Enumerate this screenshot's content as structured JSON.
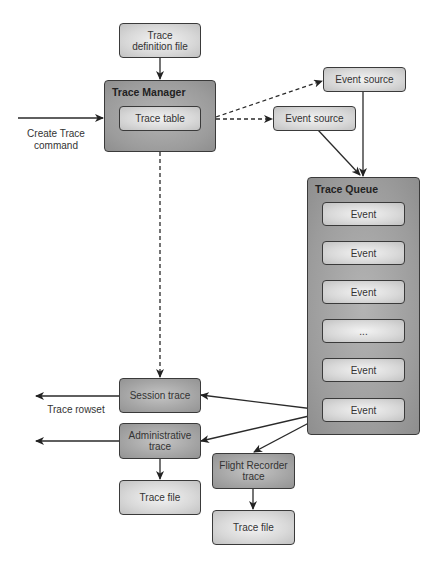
{
  "diagram": {
    "nodes": {
      "trace_definition_file": "Trace definition file",
      "trace_manager": {
        "title": "Trace Manager",
        "trace_table": "Trace table"
      },
      "event_source_1": "Event source",
      "event_source_2": "Event source",
      "trace_queue": {
        "title": "Trace Queue",
        "events": [
          "Event",
          "Event",
          "Event",
          "...",
          "Event",
          "Event"
        ]
      },
      "session_trace": "Session trace",
      "administrative_trace": "Administrative trace",
      "trace_file_admin": "Trace file",
      "flight_recorder_trace": "Flight Recorder trace",
      "trace_file_flight": "Trace file"
    },
    "labels": {
      "create_trace_command": "Create Trace command",
      "trace_rowset": "Trace rowset"
    },
    "edges": [
      {
        "from": "Trace definition file",
        "to": "Trace Manager",
        "style": "solid"
      },
      {
        "from": "Create Trace command",
        "to": "Trace Manager",
        "style": "solid"
      },
      {
        "from": "Trace Manager",
        "to": "Event source (top)",
        "style": "dashed"
      },
      {
        "from": "Trace Manager",
        "to": "Event source (lower)",
        "style": "dashed"
      },
      {
        "from": "Event source (top)",
        "to": "Trace Queue",
        "style": "solid"
      },
      {
        "from": "Event source (lower)",
        "to": "Trace Queue",
        "style": "solid"
      },
      {
        "from": "Trace Manager",
        "to": "Session trace",
        "style": "dashed"
      },
      {
        "from": "Event (last)",
        "to": "Session trace",
        "style": "solid"
      },
      {
        "from": "Event (last)",
        "to": "Administrative trace",
        "style": "solid"
      },
      {
        "from": "Event (last)",
        "to": "Flight Recorder trace",
        "style": "solid"
      },
      {
        "from": "Session trace",
        "to": "Trace rowset",
        "style": "solid"
      },
      {
        "from": "Administrative trace",
        "to": "output (left)",
        "style": "solid"
      },
      {
        "from": "Administrative trace",
        "to": "Trace file",
        "style": "solid"
      },
      {
        "from": "Flight Recorder trace",
        "to": "Trace file",
        "style": "solid"
      }
    ],
    "colors": {
      "light_box": "#d8d8d8",
      "dark_box": "#a6a6a6",
      "container": "#9c9c9c",
      "stroke": "#3a3a3a"
    }
  }
}
